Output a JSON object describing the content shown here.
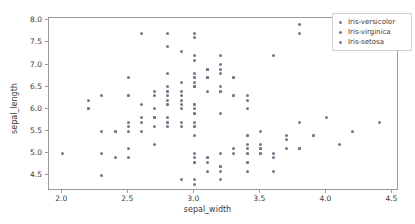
{
  "chart_data": {
    "type": "scatter",
    "title": "",
    "xlabel": "sepal_width",
    "ylabel": "sepal_length",
    "xlim": [
      1.9,
      4.55
    ],
    "ylim": [
      4.15,
      8.05
    ],
    "xticks": [
      2.0,
      2.5,
      3.0,
      3.5,
      4.0,
      4.5
    ],
    "xticklabels": [
      "2.0",
      "2.5",
      "3.0",
      "3.5",
      "4.0",
      "4.5"
    ],
    "yticks": [
      4.5,
      5.0,
      5.5,
      6.0,
      6.5,
      7.0,
      7.5,
      8.0
    ],
    "yticklabels": [
      "4.5",
      "5.0",
      "5.5",
      "6.0",
      "6.5",
      "7.0",
      "7.5",
      "8.0"
    ],
    "grid": false,
    "marker_color": "#7b7492",
    "marker_size": 3,
    "legend_position": "upper right",
    "legend_entries": [
      "Iris-versicolor",
      "Iris-virginica",
      "Iris-setosa"
    ],
    "series": [
      {
        "name": "Iris-versicolor",
        "color": "#7b7492",
        "x": [
          3.2,
          3.2,
          3.1,
          2.3,
          2.8,
          2.8,
          3.3,
          2.4,
          2.9,
          2.7,
          2.0,
          3.0,
          2.2,
          2.9,
          2.9,
          3.1,
          3.0,
          2.7,
          2.2,
          2.5,
          3.2,
          2.8,
          2.5,
          2.8,
          2.9,
          3.0,
          2.8,
          3.0,
          2.9,
          2.6,
          2.4,
          2.4,
          2.7,
          2.7,
          3.0,
          3.4,
          3.1,
          2.3,
          3.0,
          2.5,
          2.6,
          3.0,
          2.6,
          2.3,
          2.7,
          3.0,
          2.9,
          2.9,
          2.5,
          2.8
        ],
        "y": [
          7.0,
          6.4,
          6.9,
          5.5,
          6.5,
          5.7,
          6.3,
          4.9,
          6.6,
          5.2,
          5.0,
          5.9,
          6.0,
          6.1,
          5.6,
          6.7,
          5.6,
          5.8,
          6.2,
          5.6,
          5.9,
          6.1,
          6.3,
          6.1,
          6.4,
          6.6,
          6.8,
          6.7,
          6.0,
          5.7,
          5.5,
          5.5,
          5.8,
          6.0,
          5.4,
          6.0,
          6.7,
          6.3,
          5.6,
          5.5,
          5.5,
          6.1,
          5.8,
          5.0,
          5.6,
          5.7,
          5.7,
          6.2,
          5.1,
          5.7
        ]
      },
      {
        "name": "Iris-virginica",
        "color": "#7b7492",
        "x": [
          3.3,
          2.7,
          3.0,
          2.9,
          3.0,
          3.0,
          2.5,
          2.9,
          2.5,
          3.6,
          3.2,
          2.7,
          3.0,
          2.5,
          2.8,
          3.2,
          3.0,
          3.8,
          2.6,
          2.2,
          3.2,
          2.8,
          2.8,
          2.7,
          3.3,
          3.2,
          2.8,
          3.0,
          2.8,
          3.0,
          2.8,
          3.8,
          2.8,
          2.8,
          2.6,
          3.0,
          3.4,
          3.1,
          3.0,
          3.1,
          3.1,
          3.1,
          2.7,
          3.2,
          3.3,
          3.0,
          2.5,
          3.0,
          3.4,
          3.0
        ],
        "y": [
          6.3,
          5.8,
          7.1,
          6.3,
          6.5,
          7.6,
          4.9,
          7.3,
          6.7,
          7.2,
          6.5,
          6.4,
          6.8,
          5.7,
          5.8,
          6.4,
          6.5,
          7.7,
          7.7,
          6.0,
          6.9,
          5.6,
          7.7,
          6.3,
          6.7,
          7.2,
          6.2,
          6.1,
          6.4,
          7.2,
          7.4,
          7.9,
          6.4,
          6.3,
          6.1,
          7.7,
          6.3,
          6.4,
          6.0,
          6.9,
          6.7,
          6.9,
          5.8,
          6.8,
          6.7,
          6.7,
          6.3,
          6.5,
          6.2,
          5.9
        ]
      },
      {
        "name": "Iris-setosa",
        "color": "#7b7492",
        "x": [
          3.5,
          3.0,
          3.2,
          3.1,
          3.6,
          3.9,
          3.4,
          3.4,
          2.9,
          3.1,
          3.7,
          3.4,
          3.0,
          3.0,
          4.0,
          4.4,
          3.9,
          3.5,
          3.8,
          3.8,
          3.4,
          3.7,
          3.6,
          3.3,
          3.4,
          3.0,
          3.4,
          3.5,
          3.4,
          3.2,
          3.1,
          3.4,
          4.1,
          4.2,
          3.1,
          3.2,
          3.5,
          3.6,
          3.0,
          3.4,
          3.5,
          2.3,
          3.2,
          3.5,
          3.8,
          3.0,
          3.8,
          3.2,
          3.7,
          3.3
        ],
        "y": [
          5.1,
          4.9,
          4.7,
          4.6,
          5.0,
          5.4,
          4.6,
          5.0,
          4.4,
          4.9,
          5.4,
          4.8,
          4.8,
          4.3,
          5.8,
          5.7,
          5.4,
          5.1,
          5.7,
          5.1,
          5.4,
          5.1,
          4.6,
          5.1,
          4.8,
          5.0,
          5.0,
          5.2,
          5.2,
          4.7,
          4.8,
          5.4,
          5.2,
          5.5,
          4.9,
          5.0,
          5.5,
          4.9,
          4.4,
          5.1,
          5.0,
          4.5,
          4.4,
          5.0,
          5.1,
          4.8,
          5.1,
          4.6,
          5.3,
          5.0
        ]
      }
    ]
  }
}
